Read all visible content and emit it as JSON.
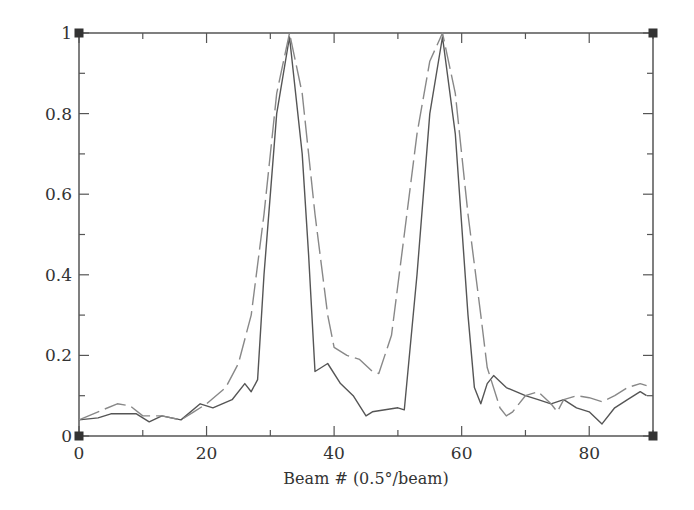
{
  "chart_data": {
    "type": "line",
    "title": "",
    "xlabel": "Beam # (0.5°/beam)",
    "ylabel": "",
    "xlim": [
      0,
      90
    ],
    "ylim": [
      0,
      1
    ],
    "x_ticks": [
      0,
      20,
      40,
      60,
      80
    ],
    "x_tick_labels": [
      "0",
      "20",
      "40",
      "60",
      "80"
    ],
    "y_ticks": [
      0,
      0.2,
      0.4,
      0.6,
      0.8,
      1
    ],
    "y_tick_labels": [
      "0",
      "0.2",
      "0.4",
      "0.6",
      "0.8",
      "1"
    ],
    "grid": false,
    "legend": null,
    "series": [
      {
        "name": "solid",
        "style": "solid",
        "color": "#555555",
        "x": [
          0,
          3,
          5,
          9,
          11,
          13,
          16,
          19,
          21,
          24,
          26,
          27,
          28,
          29,
          31,
          33,
          35,
          36,
          37,
          38,
          39,
          41,
          43,
          45,
          46,
          48,
          50,
          51,
          53,
          55,
          57,
          59,
          61,
          62,
          63,
          64,
          65,
          67,
          70,
          72,
          74,
          76,
          78,
          80,
          82,
          84,
          86,
          88,
          89
        ],
        "values": [
          0.04,
          0.045,
          0.055,
          0.055,
          0.035,
          0.05,
          0.04,
          0.08,
          0.07,
          0.09,
          0.13,
          0.11,
          0.14,
          0.4,
          0.8,
          0.99,
          0.7,
          0.45,
          0.16,
          0.17,
          0.18,
          0.13,
          0.1,
          0.05,
          0.06,
          0.065,
          0.07,
          0.065,
          0.4,
          0.8,
          0.99,
          0.75,
          0.3,
          0.12,
          0.08,
          0.13,
          0.15,
          0.12,
          0.1,
          0.09,
          0.08,
          0.09,
          0.07,
          0.06,
          0.03,
          0.07,
          0.09,
          0.11,
          0.1
        ]
      },
      {
        "name": "dashed",
        "style": "dashed",
        "color": "#888888",
        "x": [
          0,
          3,
          6,
          8,
          10,
          13,
          16,
          18,
          20,
          23,
          25,
          27,
          29,
          31,
          33,
          35,
          37,
          39,
          40,
          42,
          44,
          46,
          47,
          49,
          51,
          53,
          55,
          57,
          59,
          61,
          63,
          64,
          66,
          67,
          68,
          70,
          72,
          74,
          75,
          76,
          78,
          80,
          82,
          84,
          86,
          88,
          89
        ],
        "values": [
          0.04,
          0.06,
          0.08,
          0.075,
          0.05,
          0.05,
          0.04,
          0.06,
          0.08,
          0.12,
          0.18,
          0.3,
          0.55,
          0.85,
          1.0,
          0.85,
          0.55,
          0.3,
          0.22,
          0.2,
          0.19,
          0.16,
          0.155,
          0.25,
          0.5,
          0.75,
          0.93,
          1.0,
          0.85,
          0.55,
          0.3,
          0.17,
          0.07,
          0.05,
          0.06,
          0.1,
          0.11,
          0.08,
          0.06,
          0.09,
          0.1,
          0.095,
          0.085,
          0.1,
          0.12,
          0.13,
          0.125
        ]
      }
    ]
  },
  "plot": {
    "left": 79,
    "top": 33,
    "right": 653,
    "bottom": 436,
    "axis_color": "#555555"
  }
}
